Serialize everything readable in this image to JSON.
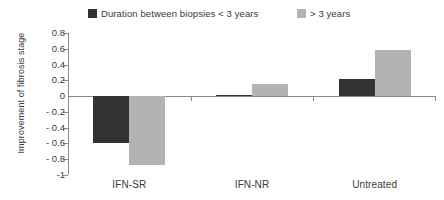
{
  "chart_data": {
    "type": "bar",
    "title": "",
    "xlabel": "",
    "ylabel": "Improvement of fibrosis stage",
    "categories": [
      "IFN-SR",
      "IFN-NR",
      "Untreated"
    ],
    "series": [
      {
        "name": "Duration between biopsies < 3 years",
        "color": "#333333",
        "values": [
          -0.6,
          0.01,
          0.22
        ]
      },
      {
        "name": "> 3 years",
        "color": "#b3b3b3",
        "values": [
          -0.87,
          0.15,
          0.58
        ]
      }
    ],
    "ylim": [
      -1,
      0.8
    ],
    "ytick_labels": [
      "0.8",
      "0.6",
      "0.4",
      "0.2",
      "0",
      "- 0.2",
      "- 0.4",
      "- 0.6",
      "- 0.8",
      "-1"
    ],
    "ytick_values": [
      0.8,
      0.6,
      0.4,
      0.2,
      0,
      -0.2,
      -0.4,
      -0.6,
      -0.8,
      -1
    ],
    "grid": false,
    "legend_position": "top",
    "zero_line": true
  },
  "legend": {
    "entries": [
      {
        "label": "Duration between biopsies < 3 years",
        "color": "#333333",
        "swatch_name": "legend-swatch-dark"
      },
      {
        "label": "> 3 years",
        "color": "#b3b3b3",
        "swatch_name": "legend-swatch-light"
      }
    ]
  },
  "axis": {
    "y_title": "Improvement of fibrosis stage"
  }
}
